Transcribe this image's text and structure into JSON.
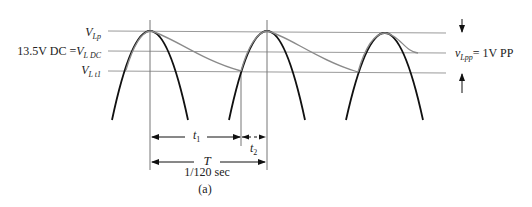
{
  "figure": {
    "caption": "(a)",
    "levels": {
      "peak": {
        "symbol": "V",
        "subscript": "Lp"
      },
      "dc": {
        "prefix": "13.5V DC =",
        "symbol": "V",
        "subscript": "L DC"
      },
      "t1": {
        "symbol": "V",
        "subscript": "L t1"
      }
    },
    "ripple": {
      "symbol": "v",
      "subscript": "Lpp",
      "value": "= 1V PP"
    },
    "dimensions": {
      "t1": {
        "symbol": "t",
        "subscript": "1"
      },
      "t2": {
        "symbol": "t",
        "subscript": "2"
      },
      "period": {
        "symbol": "T",
        "value": "1/120 sec"
      }
    },
    "colors": {
      "rectified_wave": "#111111",
      "filtered_output": "#8a8a8a",
      "reference_lines": "#9a9a9a"
    }
  }
}
